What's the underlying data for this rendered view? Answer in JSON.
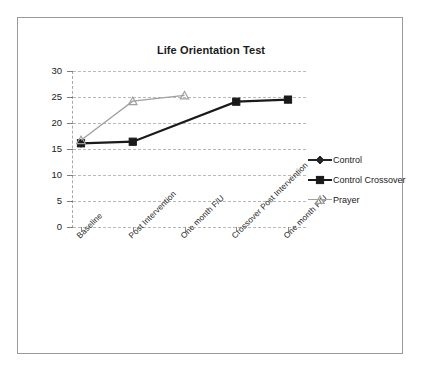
{
  "chart_data": {
    "type": "line",
    "title": "Life Orientation Test",
    "xlabel": "",
    "ylabel": "",
    "ylim": [
      0,
      30
    ],
    "yticks": [
      "0",
      "5",
      "10",
      "15",
      "20",
      "25",
      "30"
    ],
    "grid": true,
    "legend_position": "right",
    "categories": [
      "Baseline",
      "Post Intervention",
      "One month F/U",
      "Crossover Post Intervention",
      "One month F/U"
    ],
    "series": [
      {
        "name": "Control",
        "marker": "diamond",
        "color": "#262626",
        "values": [
          16.1,
          null,
          null,
          null,
          null
        ]
      },
      {
        "name": "Control Crossover",
        "marker": "square",
        "color": "#1a1a1a",
        "values": [
          16.1,
          16.4,
          null,
          24.1,
          24.5
        ]
      },
      {
        "name": "Prayer",
        "marker": "triangle",
        "color": "#a0a0a0",
        "values": [
          16.7,
          24.2,
          25.3,
          null,
          null
        ]
      }
    ]
  },
  "legend": {
    "items": [
      {
        "label": "Control",
        "color": "#262626",
        "marker": "diamond"
      },
      {
        "label": "Control Crossover",
        "color": "#1a1a1a",
        "marker": "square"
      },
      {
        "label": "Prayer",
        "color": "#a0a0a0",
        "marker": "triangle"
      }
    ]
  },
  "colors": {
    "frame_border": "#9a9a9a",
    "gridline": "#b9b9b9",
    "text": "#1a1a1a",
    "control": "#262626",
    "control_crossover": "#1a1a1a",
    "prayer": "#a0a0a0"
  }
}
